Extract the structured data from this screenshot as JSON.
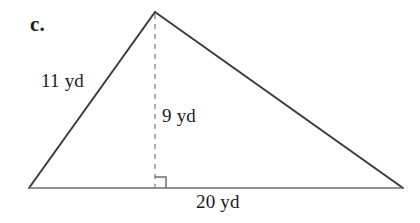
{
  "figure": {
    "item_letter": "c.",
    "background_color": "#ffffff",
    "stroke_color": "#3b3b3b",
    "base_stroke_color": "#6e6e6e",
    "dash_color": "#8a8a8a",
    "text_color": "#1b1b1b",
    "shape": "triangle",
    "labels": {
      "left_side": "11 yd",
      "height": "9 yd",
      "base": "20 yd"
    },
    "measurements": {
      "left_side_value": 11,
      "height_value": 9,
      "base_value": 20,
      "unit": "yd"
    },
    "geometry": {
      "apex": [
        155,
        12
      ],
      "left_vertex": [
        29,
        188
      ],
      "right_vertex": [
        403,
        188
      ],
      "foot_of_altitude": [
        155,
        188
      ],
      "right_angle_marker_size": 11
    }
  }
}
